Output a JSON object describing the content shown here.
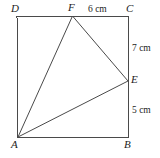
{
  "figure": {
    "type": "geometry-diagram",
    "shape": "square-with-inscribed-triangle",
    "background_color": "#ffffff",
    "stroke_color": "#4a4a4a",
    "label_color": "#1c1c1c",
    "vertices": [
      {
        "id": "D",
        "label": "D",
        "x": 17,
        "y": 16,
        "role": "square-corner-top-left"
      },
      {
        "id": "C",
        "label": "C",
        "x": 128,
        "y": 16,
        "role": "square-corner-top-right"
      },
      {
        "id": "B",
        "label": "B",
        "x": 128,
        "y": 137,
        "role": "square-corner-bottom-right"
      },
      {
        "id": "A",
        "label": "A",
        "x": 18,
        "y": 137,
        "role": "square-corner-bottom-left"
      },
      {
        "id": "F",
        "label": "F",
        "x": 72.5,
        "y": 16,
        "role": "point-on-top-edge"
      },
      {
        "id": "E",
        "label": "E",
        "x": 128,
        "y": 81,
        "role": "point-on-right-edge"
      }
    ],
    "square_path": "M 17 16 L 128 16 L 128 137 L 18 137 Z",
    "triangle_path": "M 18 137 L 72.5 16 L 128 81 Z",
    "segments": [
      {
        "from": "D",
        "to": "C",
        "kind": "square-side"
      },
      {
        "from": "C",
        "to": "B",
        "kind": "square-side"
      },
      {
        "from": "B",
        "to": "A",
        "kind": "square-side"
      },
      {
        "from": "A",
        "to": "D",
        "kind": "square-side"
      },
      {
        "from": "A",
        "to": "F",
        "kind": "triangle-side"
      },
      {
        "from": "F",
        "to": "E",
        "kind": "triangle-side"
      },
      {
        "from": "A",
        "to": "E",
        "kind": "triangle-side"
      }
    ],
    "dimensions": [
      {
        "id": "FC",
        "text": "6 cm",
        "value": 6,
        "unit": "cm",
        "segment": "F-C",
        "side": "top"
      },
      {
        "id": "CE",
        "text": "7 cm",
        "value": 7,
        "unit": "cm",
        "segment": "C-E",
        "side": "right-upper"
      },
      {
        "id": "EB",
        "text": "5 cm",
        "value": 5,
        "unit": "cm",
        "segment": "E-B",
        "side": "right-lower"
      }
    ]
  },
  "labels": {
    "D": "D",
    "F": "F",
    "C": "C",
    "E": "E",
    "B": "B",
    "A": "A",
    "dim_top": "6 cm",
    "dim_right_upper": "7 cm",
    "dim_right_lower": "5 cm"
  }
}
